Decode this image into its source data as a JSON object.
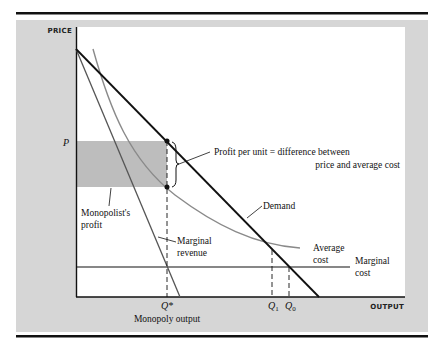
{
  "figure": {
    "axes": {
      "y_label": "PRICE",
      "x_label": "OUTPUT"
    },
    "curves": {
      "demand": "Demand",
      "marginal_revenue": [
        "Marginal",
        "revenue"
      ],
      "average_cost": [
        "Average",
        "cost"
      ],
      "marginal_cost": [
        "Marginal",
        "cost"
      ]
    },
    "annotations": {
      "price_level": "P",
      "profit_per_unit": [
        "Profit per unit = difference between",
        "price and average cost"
      ],
      "monopolist_profit": [
        "Monopolist's",
        "profit"
      ],
      "q_star": "Q*",
      "q_star_caption": "Monopoly output",
      "q1": "Q",
      "q1_sub": "1",
      "q0": "Q",
      "q0_sub": "0"
    },
    "colors": {
      "panel": "#d6d6d6",
      "profit_area": "#bdbdbd",
      "curve_dark": "#111111",
      "curve_gray": "#8a8a8a",
      "rule": "#111111"
    }
  }
}
